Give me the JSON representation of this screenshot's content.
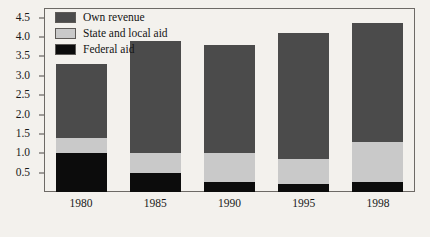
{
  "chart_data": {
    "type": "bar",
    "subtype": "stacked-vertical",
    "title": "",
    "xlabel": "",
    "ylabel": "",
    "categories": [
      "1980",
      "1985",
      "1990",
      "1995",
      "1998"
    ],
    "series": [
      {
        "name": "Federal aid",
        "color": "#0c0c0c",
        "values": [
          1.0,
          0.5,
          0.25,
          0.2,
          0.25
        ]
      },
      {
        "name": "State and local aid",
        "color": "#c9c9c9",
        "values": [
          0.4,
          0.5,
          0.75,
          0.65,
          1.05
        ]
      },
      {
        "name": "Own revenue",
        "color": "#4b4b4b",
        "values": [
          1.9,
          2.9,
          2.8,
          3.25,
          3.05
        ]
      }
    ],
    "totals": [
      3.3,
      3.9,
      3.8,
      4.1,
      4.35
    ],
    "ylim": [
      0,
      4.75
    ],
    "yticks": [
      0.5,
      1.0,
      1.5,
      2.0,
      2.5,
      3.0,
      3.5,
      4.0,
      4.5
    ],
    "ytick_labels": [
      "0.5",
      "1.0",
      "1.5",
      "2.0",
      "2.5",
      "3.0",
      "3.5",
      "4.0",
      "4.5"
    ],
    "grid": false,
    "legend_position": "top-left",
    "legend_entries": [
      "Own revenue",
      "State and local aid",
      "Federal aid"
    ],
    "background_color": "#f3f1ed",
    "frame_color": "#6d6a66"
  },
  "legend": {
    "items": [
      {
        "label": "Own revenue",
        "swatch_name": "legend-swatch-own-revenue"
      },
      {
        "label": "State and local aid",
        "swatch_name": "legend-swatch-state-local-aid"
      },
      {
        "label": "Federal aid",
        "swatch_name": "legend-swatch-federal-aid"
      }
    ]
  }
}
